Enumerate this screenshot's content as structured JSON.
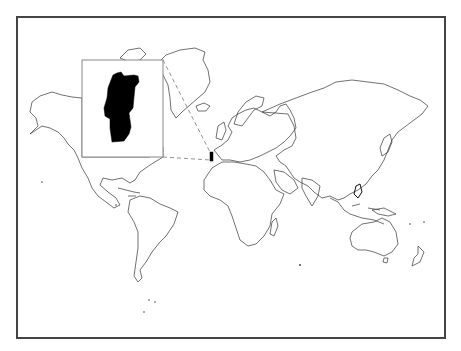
{
  "map": {
    "type": "world-locator-map",
    "projection": "Miller-like cylindrical",
    "highlighted_country": "Portugal",
    "highlight_color": "#000000",
    "outline_color": "#333333",
    "frame_color": "#444444",
    "background_color": "#ffffff",
    "inset": {
      "subject": "Portugal",
      "fill": "#000000",
      "border_color": "#888888"
    },
    "leader_lines": "dashed"
  }
}
